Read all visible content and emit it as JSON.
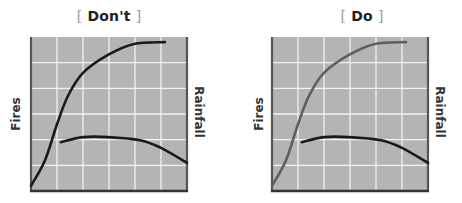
{
  "chart_data": [
    {
      "type": "line",
      "title": "Don't",
      "title_brackets": [
        "[",
        "]"
      ],
      "ylabel_left": "Fires",
      "ylabel_right": "Rainfall",
      "xlabel": "",
      "xlim": [
        0,
        6
      ],
      "ylim": [
        0,
        6
      ],
      "grid": true,
      "plot_background": "#b4b4b4",
      "grid_color": "#f2f2f2",
      "series": [
        {
          "name": "Fires",
          "color": "#1a1a1a",
          "x": [
            0,
            0.54,
            1.0,
            1.42,
            2.0,
            2.96,
            3.96,
            5.15
          ],
          "y": [
            0.2,
            1.2,
            2.6,
            3.7,
            4.6,
            5.3,
            5.73,
            5.8
          ]
        },
        {
          "name": "Rainfall",
          "color": "#1a1a1a",
          "x": [
            1.15,
            2.0,
            2.96,
            4.19,
            4.96,
            6.0
          ],
          "y": [
            1.9,
            2.1,
            2.1,
            1.98,
            1.7,
            1.1
          ]
        }
      ]
    },
    {
      "type": "line",
      "title": "Do",
      "title_brackets": [
        "[",
        "]"
      ],
      "ylabel_left": "Fires",
      "ylabel_right": "Rainfall",
      "xlabel": "",
      "xlim": [
        0,
        6
      ],
      "ylim": [
        0,
        6
      ],
      "grid": true,
      "plot_background": "#b4b4b4",
      "grid_color": "#f2f2f2",
      "series": [
        {
          "name": "Fires",
          "color": "#5e5e5e",
          "x": [
            0,
            0.54,
            1.0,
            1.42,
            2.0,
            2.96,
            3.96,
            5.15
          ],
          "y": [
            0.2,
            1.2,
            2.6,
            3.7,
            4.6,
            5.3,
            5.73,
            5.8
          ]
        },
        {
          "name": "Rainfall",
          "color": "#1a1a1a",
          "x": [
            1.15,
            2.0,
            2.96,
            4.19,
            4.96,
            6.0
          ],
          "y": [
            1.9,
            2.1,
            2.1,
            1.98,
            1.7,
            1.1
          ]
        }
      ]
    }
  ]
}
